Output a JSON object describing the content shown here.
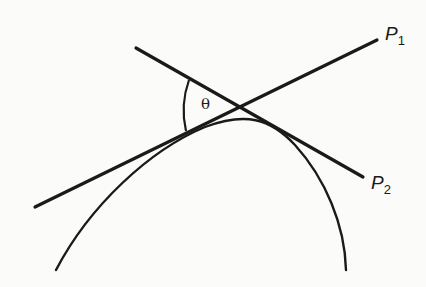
{
  "diagram": {
    "type": "geometry",
    "labels": {
      "p1": {
        "main": "P",
        "sub": "1"
      },
      "p2": {
        "main": "P",
        "sub": "2"
      },
      "angle": "θ"
    },
    "colors": {
      "stroke": "#1a1a1a",
      "background": "#fbfbf9"
    }
  }
}
